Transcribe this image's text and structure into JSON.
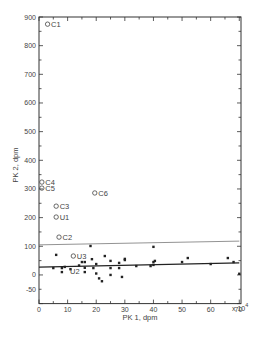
{
  "chart_data": {
    "type": "scatter",
    "title": "",
    "xlabel": "PK 1, dpm",
    "ylabel": "PK 2, dpm",
    "x_unit_suffix": "x 10",
    "x_unit_exponent": "4",
    "xlim": [
      0,
      70
    ],
    "ylim": [
      -100,
      900
    ],
    "grid": false,
    "legend": null,
    "x_ticks": [
      "0",
      "10",
      "20",
      "30",
      "40",
      "50",
      "60",
      "70"
    ],
    "y_ticks": [
      "900",
      "800",
      "700",
      "600",
      "500",
      "400",
      "300",
      "200",
      "100",
      "0",
      "-50"
    ],
    "labeled_points": [
      {
        "label": "C1",
        "x": 3,
        "y": 875,
        "marker": "open-circle"
      },
      {
        "label": "C4",
        "x": 1,
        "y": 324,
        "marker": "open-circle"
      },
      {
        "label": "C5",
        "x": 1,
        "y": 303,
        "marker": "open-circle"
      },
      {
        "label": "C6",
        "x": 19.5,
        "y": 286,
        "marker": "open-circle"
      },
      {
        "label": "C3",
        "x": 6,
        "y": 240,
        "marker": "open-circle"
      },
      {
        "label": "U1",
        "x": 6,
        "y": 202,
        "marker": "open-circle"
      },
      {
        "label": "C2",
        "x": 7,
        "y": 132,
        "marker": "open-circle"
      },
      {
        "label": "U3",
        "x": 12,
        "y": 66,
        "marker": "open-circle"
      },
      {
        "label": "U2",
        "x": 10.5,
        "y": 22,
        "marker": "none"
      }
    ],
    "series": [
      {
        "name": "samples",
        "marker": "filled-dot",
        "points": [
          [
            5,
            24
          ],
          [
            6,
            70
          ],
          [
            8,
            24
          ],
          [
            8,
            10
          ],
          [
            9,
            28
          ],
          [
            11,
            20
          ],
          [
            14,
            33
          ],
          [
            15,
            45
          ],
          [
            16,
            45
          ],
          [
            16,
            25
          ],
          [
            16,
            10
          ],
          [
            18,
            101
          ],
          [
            18.5,
            55
          ],
          [
            19,
            24
          ],
          [
            20,
            38
          ],
          [
            20,
            5
          ],
          [
            21,
            -12
          ],
          [
            22,
            -22
          ],
          [
            23,
            66
          ],
          [
            25,
            49
          ],
          [
            25,
            24
          ],
          [
            25,
            0
          ],
          [
            28,
            42
          ],
          [
            28,
            24
          ],
          [
            29,
            -7
          ],
          [
            30,
            56
          ],
          [
            30,
            52
          ],
          [
            34,
            31
          ],
          [
            39,
            31
          ],
          [
            40,
            98
          ],
          [
            40,
            45
          ],
          [
            40.5,
            49
          ],
          [
            40,
            35
          ],
          [
            50,
            45
          ],
          [
            52,
            59
          ],
          [
            60,
            38
          ],
          [
            66,
            59
          ],
          [
            68,
            45
          ],
          [
            70,
            4
          ]
        ]
      }
    ],
    "lines": [
      {
        "name": "upper-bound-line",
        "x": [
          0,
          70
        ],
        "y": [
          105,
          118
        ]
      },
      {
        "name": "regression-line",
        "x": [
          0,
          70
        ],
        "y": [
          27,
          42
        ]
      }
    ]
  }
}
